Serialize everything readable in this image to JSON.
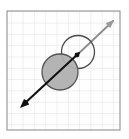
{
  "figure": {
    "canvas": {
      "width": 129,
      "height": 139,
      "background": "#ffffff"
    },
    "frame": {
      "label": "plot-frame",
      "x": 7,
      "y": 11,
      "width": 113,
      "height": 119,
      "stroke": "#9a9a9a",
      "stroke_width": 1.2,
      "fill": "#fefefe"
    },
    "grid": {
      "label": "background-grid",
      "cell_size": 11.3,
      "stroke": "#d8d8d8",
      "stroke_width": 0.7,
      "columns": 10,
      "rows": 10,
      "visible": true
    }
  },
  "shapes": {
    "filled_circle": {
      "label": "Filled gray circle",
      "cx": 60,
      "cy": 72,
      "r": 18,
      "fill": "#b0b0b0",
      "stroke": "#555555",
      "stroke_width": 1.3,
      "opacity": 0.95
    },
    "open_circle": {
      "label": "Open white circle",
      "cx": 78,
      "cy": 52,
      "r": 16.5,
      "fill": "#ffffff",
      "stroke": "#4a4a4a",
      "stroke_width": 1.3,
      "opacity": 1
    }
  },
  "vector": {
    "label": "Double-headed displacement arrow",
    "start": {
      "x": 22,
      "y": 106
    },
    "end": {
      "x": 113,
      "y": 21
    },
    "dark_segment": {
      "label": "lower-left dark half",
      "x1": 22,
      "y1": 106,
      "x2": 79,
      "y2": 53,
      "stroke": "#111111",
      "stroke_width": 2.1
    },
    "light_segment": {
      "label": "upper-right light half",
      "x1": 76,
      "y1": 56,
      "x2": 113,
      "y2": 21,
      "stroke": "#8d8d8d",
      "stroke_width": 1.8
    },
    "arrowhead_start": {
      "label": "lower-left arrowhead",
      "tip": {
        "x": 20,
        "y": 108
      },
      "fill": "#111111",
      "size": 9
    },
    "arrowhead_end": {
      "label": "upper-right arrowhead",
      "tip": {
        "x": 114,
        "y": 20
      },
      "fill": "#9a9a9a",
      "size": 8
    },
    "contact_point": {
      "label": "tangency/contact dot",
      "cx": 77,
      "cy": 55,
      "r": 2.4,
      "fill": "#111111"
    }
  }
}
